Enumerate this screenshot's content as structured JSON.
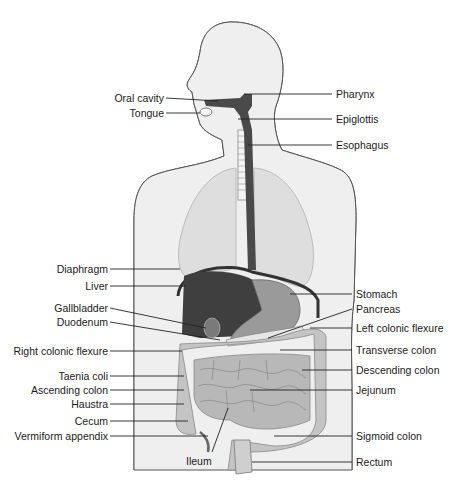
{
  "figure": {
    "colors": {
      "body_fill": "#ececec",
      "body_outline": "#444444",
      "lung_fill": "#dcdcdc",
      "liver": "#3f3f3f",
      "organ_mid": "#9a9a9a",
      "intestine": "#bdbdbd",
      "esophagus": "#4a4a4a",
      "leader_line": "#222222"
    },
    "labels_left": [
      {
        "id": "oral-cavity",
        "text": "Oral cavity",
        "x": 163,
        "y": 92,
        "tx": 218,
        "ty": 100
      },
      {
        "id": "tongue",
        "text": "Tongue",
        "x": 163,
        "y": 108,
        "tx": 200,
        "ty": 112
      },
      {
        "id": "diaphragm",
        "text": "Diaphragm",
        "x": 107,
        "y": 263,
        "tx": 178,
        "ty": 268
      },
      {
        "id": "liver",
        "text": "Liver",
        "x": 107,
        "y": 280,
        "tx": 182,
        "ty": 286
      },
      {
        "id": "gallbladder",
        "text": "Gallbladder",
        "x": 107,
        "y": 302,
        "tx": 202,
        "ty": 328
      },
      {
        "id": "duodenum",
        "text": "Duodenum",
        "x": 107,
        "y": 316,
        "tx": 218,
        "ty": 340
      },
      {
        "id": "right-colonic-flexure",
        "text": "Right colonic flexure",
        "x": 107,
        "y": 346,
        "tx": 180,
        "ty": 351
      },
      {
        "id": "taenia-coli",
        "text": "Taenia coli",
        "x": 107,
        "y": 370,
        "tx": 182,
        "ty": 375
      },
      {
        "id": "ascending-colon",
        "text": "Ascending colon",
        "x": 107,
        "y": 384,
        "tx": 182,
        "ty": 389
      },
      {
        "id": "haustra",
        "text": "Haustra",
        "x": 107,
        "y": 398,
        "tx": 182,
        "ty": 403
      },
      {
        "id": "cecum",
        "text": "Cecum",
        "x": 107,
        "y": 416,
        "tx": 186,
        "ty": 420
      },
      {
        "id": "vermiform-appendix",
        "text": "Vermiform appendix",
        "x": 107,
        "y": 431,
        "tx": 208,
        "ty": 436
      }
    ],
    "labels_right": [
      {
        "id": "pharynx",
        "text": "Pharynx",
        "x": 336,
        "y": 88,
        "tx": 244,
        "ty": 102
      },
      {
        "id": "epiglottis",
        "text": "Epiglottis",
        "x": 336,
        "y": 113,
        "tx": 238,
        "ty": 118
      },
      {
        "id": "esophagus",
        "text": "Esophagus",
        "x": 336,
        "y": 139,
        "tx": 248,
        "ty": 145
      },
      {
        "id": "stomach",
        "text": "Stomach",
        "x": 356,
        "y": 288,
        "tx": 290,
        "ty": 293
      },
      {
        "id": "pancreas",
        "text": "Pancreas",
        "x": 356,
        "y": 304,
        "tx": 268,
        "ty": 338
      },
      {
        "id": "left-colonic-flexure",
        "text": "Left colonic flexure",
        "x": 356,
        "y": 322,
        "tx": 308,
        "ty": 327
      },
      {
        "id": "transverse-colon",
        "text": "Transverse colon",
        "x": 356,
        "y": 344,
        "tx": 280,
        "ty": 349
      },
      {
        "id": "descending-colon",
        "text": "Descending colon",
        "x": 356,
        "y": 364,
        "tx": 302,
        "ty": 369
      },
      {
        "id": "jejunum",
        "text": "Jejunum",
        "x": 356,
        "y": 384,
        "tx": 248,
        "ty": 389
      },
      {
        "id": "sigmoid-colon",
        "text": "Sigmoid colon",
        "x": 356,
        "y": 431,
        "tx": 272,
        "ty": 436
      },
      {
        "id": "rectum",
        "text": "Rectum",
        "x": 356,
        "y": 458,
        "tx": 252,
        "ty": 462
      }
    ],
    "labels_bottom": [
      {
        "id": "ileum",
        "text": "Ileum",
        "x": 186,
        "y": 455,
        "tx": 228,
        "ty": 408
      }
    ]
  }
}
